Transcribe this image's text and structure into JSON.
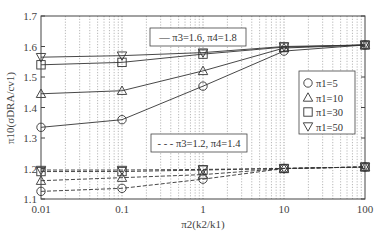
{
  "chart_data": {
    "type": "line",
    "title": "",
    "xlabel": "π2(k2/k1)",
    "ylabel": "π10(σDRA/cv1)",
    "x_scale": "log",
    "x": [
      0.01,
      0.1,
      1,
      10,
      100
    ],
    "x_tick_labels": [
      "0.01",
      "0.1",
      "1",
      "10",
      "100"
    ],
    "ylim": [
      1.1,
      1.7
    ],
    "y_ticks": [
      1.1,
      1.2,
      1.3,
      1.4,
      1.5,
      1.6,
      1.7
    ],
    "y_tick_labels": [
      "1.1",
      "1.2",
      "1.3",
      "1.4",
      "1.5",
      "1.6",
      "1.7"
    ],
    "grid": "vertical dotted minor/major log grid",
    "groups": [
      {
        "label": "— π3=1.6, π4=1.8",
        "line_style": "solid",
        "series": [
          {
            "name": "π1=5",
            "marker": "circle",
            "values": [
              1.335,
              1.36,
              1.47,
              1.585,
              1.605
            ]
          },
          {
            "name": "π1=10",
            "marker": "triangle-up",
            "values": [
              1.445,
              1.455,
              1.52,
              1.595,
              1.605
            ]
          },
          {
            "name": "π1=30",
            "marker": "square",
            "values": [
              1.54,
              1.548,
              1.575,
              1.598,
              1.605
            ]
          },
          {
            "name": "π1=50",
            "marker": "triangle-down",
            "values": [
              1.565,
              1.57,
              1.58,
              1.6,
              1.605
            ]
          }
        ]
      },
      {
        "label": "- - - π3=1.2, π4=1.4",
        "line_style": "dashed",
        "series": [
          {
            "name": "π1=5",
            "marker": "circle",
            "values": [
              1.125,
              1.135,
              1.165,
              1.2,
              1.205
            ]
          },
          {
            "name": "π1=10",
            "marker": "triangle-up",
            "values": [
              1.16,
              1.17,
              1.18,
              1.2,
              1.205
            ]
          },
          {
            "name": "π1=30",
            "marker": "square",
            "values": [
              1.19,
              1.19,
              1.195,
              1.2,
              1.205
            ]
          },
          {
            "name": "π1=50",
            "marker": "triangle-down",
            "values": [
              1.195,
              1.195,
              1.197,
              1.2,
              1.205
            ]
          }
        ]
      }
    ],
    "legend": {
      "position": "right-middle",
      "entries": [
        {
          "marker": "circle",
          "label": "π1=5"
        },
        {
          "marker": "triangle-up",
          "label": "π1=10"
        },
        {
          "marker": "square",
          "label": "π1=30"
        },
        {
          "marker": "triangle-down",
          "label": "π1=50"
        }
      ]
    },
    "annotations": [
      {
        "text": "— π3=1.6, π4=1.8",
        "position": "upper-center"
      },
      {
        "text": "- - - π3=1.2, π4=1.4",
        "position": "lower-center"
      }
    ]
  },
  "colors": {
    "line": "#333333",
    "grid": "#888888",
    "axis": "#444444"
  }
}
